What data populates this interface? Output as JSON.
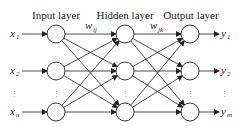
{
  "layers": [
    {
      "name": "Input layer",
      "x": 56
    },
    {
      "name": "Hidden layer",
      "x": 125
    },
    {
      "name": "Output layer",
      "x": 190
    }
  ],
  "rows_y": [
    34,
    71,
    112
  ],
  "ellipsis_y": 93,
  "node_radius": 9,
  "inputs": [
    {
      "var": "x",
      "sub": "1"
    },
    {
      "var": "x",
      "sub": "2"
    },
    {
      "var": "x",
      "sub": "n"
    }
  ],
  "outputs": [
    {
      "var": "y",
      "sub": "1"
    },
    {
      "var": "y",
      "sub": "2"
    },
    {
      "var": "y",
      "sub": "m"
    }
  ],
  "weights": [
    {
      "var": "w",
      "sub": "ij"
    },
    {
      "var": "w",
      "sub": "jk"
    }
  ],
  "ellipsis": "⋮",
  "colors": {
    "stroke": "#222222",
    "text": "#222222",
    "background": "#ffffff"
  }
}
